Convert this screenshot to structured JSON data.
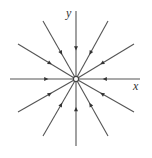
{
  "diagram": {
    "type": "phase-portrait",
    "center": [
      76,
      79
    ],
    "line_color": "#555555",
    "node_fill": "#ffffff",
    "axes": {
      "x_label": "x",
      "y_label": "y"
    },
    "trajectories": [
      {
        "id": "top",
        "from": [
          76,
          11
        ]
      },
      {
        "id": "upper-right-steep",
        "from": [
          108,
          21
        ]
      },
      {
        "id": "upper-right-shallow",
        "from": [
          134,
          44
        ]
      },
      {
        "id": "right",
        "from": [
          140,
          79
        ]
      },
      {
        "id": "lower-right-shallow",
        "from": [
          134,
          112
        ]
      },
      {
        "id": "lower-right-steep",
        "from": [
          108,
          136
        ]
      },
      {
        "id": "bottom",
        "from": [
          76,
          146
        ]
      },
      {
        "id": "lower-left-steep",
        "from": [
          43,
          136
        ]
      },
      {
        "id": "lower-left-shallow",
        "from": [
          18,
          112
        ]
      },
      {
        "id": "left",
        "from": [
          10,
          79
        ]
      },
      {
        "id": "upper-left-shallow",
        "from": [
          18,
          44
        ]
      },
      {
        "id": "upper-left-steep",
        "from": [
          43,
          21
        ]
      }
    ],
    "arrow_direction": "inward"
  }
}
